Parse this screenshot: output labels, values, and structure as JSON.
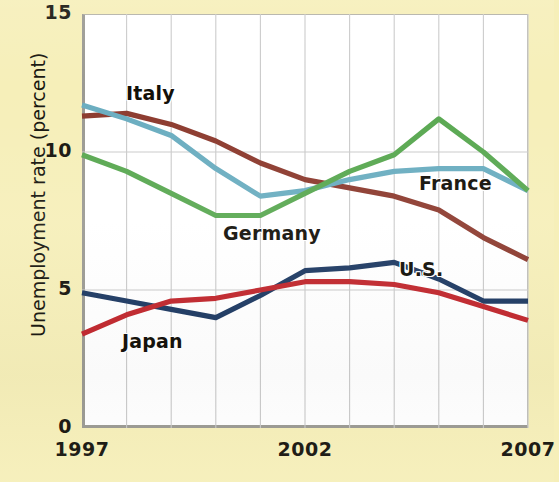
{
  "figure": {
    "background_color": "#f6efb9",
    "plot_background_color": "#ffffff",
    "axis_color": "#9b9a93",
    "grid_color": "#c9c9c9"
  },
  "axis": {
    "y_label": "Unemployment rate (percent)",
    "y_ticks": [
      "0",
      "5",
      "10",
      "15"
    ],
    "x_ticks": [
      "1997",
      "2002",
      "2007"
    ]
  },
  "series_labels": [
    {
      "name": "Italy",
      "text": "Italy",
      "left": 126,
      "top": 82,
      "color": "#8c3a2e"
    },
    {
      "name": "France",
      "text": "France",
      "left": 419,
      "top": 172,
      "color": "#6aadc0"
    },
    {
      "name": "Germany",
      "text": "Germany",
      "left": 223,
      "top": 222,
      "color": "#59a851"
    },
    {
      "name": "us",
      "text": "U.S.",
      "left": 399,
      "top": 258,
      "color": "#1e3a63"
    },
    {
      "name": "Japan",
      "text": "Japan",
      "left": 122,
      "top": 330,
      "color": "#c1272d"
    }
  ],
  "chart_data": {
    "type": "line",
    "title": "",
    "xlabel": "",
    "ylabel": "Unemployment rate (percent)",
    "xlim": [
      1997,
      2007
    ],
    "ylim": [
      0,
      15
    ],
    "ytick_values": [
      0,
      5,
      10,
      15
    ],
    "xtick_values": [
      1997,
      2002,
      2007
    ],
    "grid": true,
    "grid_axis": "x",
    "legend": "inline-labels",
    "x": [
      1997,
      1998,
      1999,
      2000,
      2001,
      2002,
      2003,
      2004,
      2005,
      2006,
      2007
    ],
    "series": [
      {
        "name": "Italy",
        "color": "#8c3a2e",
        "values": [
          11.3,
          11.4,
          11.0,
          10.4,
          9.6,
          9.0,
          8.7,
          8.4,
          7.9,
          6.9,
          6.1
        ]
      },
      {
        "name": "France",
        "color": "#6aadc0",
        "values": [
          11.7,
          11.2,
          10.6,
          9.4,
          8.4,
          8.6,
          9.0,
          9.3,
          9.4,
          9.4,
          8.6
        ]
      },
      {
        "name": "Germany",
        "color": "#59a851",
        "values": [
          9.9,
          9.3,
          8.5,
          7.7,
          7.7,
          8.5,
          9.3,
          9.9,
          11.2,
          10.0,
          8.6
        ]
      },
      {
        "name": "U.S.",
        "color": "#1e3a63",
        "values": [
          4.9,
          4.6,
          4.3,
          4.0,
          4.8,
          5.7,
          5.8,
          6.0,
          5.4,
          4.6,
          4.6
        ]
      },
      {
        "name": "Japan",
        "color": "#c1272d",
        "values": [
          3.4,
          4.1,
          4.6,
          4.7,
          5.0,
          5.3,
          5.3,
          5.2,
          4.9,
          4.4,
          3.9
        ]
      }
    ]
  }
}
